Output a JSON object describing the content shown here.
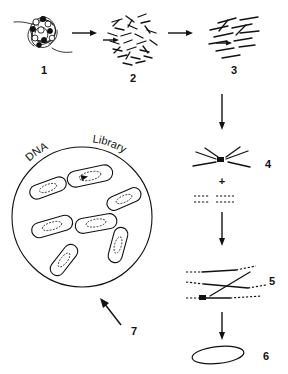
{
  "diagram": {
    "ink_color": "#111111",
    "background": "#ffffff",
    "steps": [
      {
        "id": "1",
        "label": "1",
        "name": "chromatin-coil",
        "description": "tangled genomic DNA with nucleosome beads"
      },
      {
        "id": "2",
        "label": "2",
        "name": "fragment-cloud-dense",
        "description": "dense cloud of randomly sheared DNA fragments"
      },
      {
        "id": "3",
        "label": "3",
        "name": "fragment-cloud-sparse",
        "description": "fewer, size-selected aligned fragments"
      },
      {
        "id": "4",
        "label": "4",
        "name": "fragments-plus-adapters",
        "description": "selected fragments plus adapter oligos"
      },
      {
        "id": "5",
        "label": "5",
        "name": "adapter-ligated-fragments",
        "description": "fragments with adapters ligated to both ends"
      },
      {
        "id": "6",
        "label": "6",
        "name": "vector-construct",
        "description": "circular vector carrying the insert"
      },
      {
        "id": "7",
        "label": "7",
        "name": "transformation-arrow",
        "description": "transformation into host cells"
      }
    ],
    "plus_sign": "+",
    "dish": {
      "label_left": "DNA",
      "label_right": "Library",
      "colony_count": 7
    },
    "arrows": [
      {
        "name": "arrow-1-to-2",
        "direction": "right"
      },
      {
        "name": "arrow-2-to-3",
        "direction": "right"
      },
      {
        "name": "arrow-3-to-4",
        "direction": "down"
      },
      {
        "name": "arrow-4-to-5",
        "direction": "down"
      },
      {
        "name": "arrow-5-to-6",
        "direction": "down"
      },
      {
        "name": "arrow-6-to-dish",
        "direction": "up-left"
      }
    ]
  }
}
